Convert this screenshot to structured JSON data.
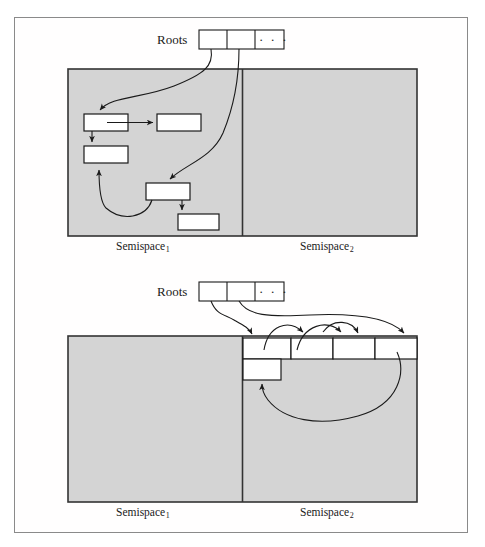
{
  "figure": {
    "background_color": "#ffffff",
    "frame_color": "#8a8a8a",
    "semispace_fill": "#d4d4d4",
    "semispace_stroke": "#333333",
    "object_fill": "#ffffff",
    "object_stroke": "#1a1a1a",
    "arrow_color": "#1a1a1a"
  },
  "panels": [
    {
      "id": "before",
      "roots": {
        "label": "Roots",
        "cells": [
          "",
          "",
          "· · ·"
        ],
        "cell_count": 3
      },
      "semispaces": [
        {
          "id": "semispace-1",
          "label": "Semispace",
          "subscript": "1",
          "state": "occupied"
        },
        {
          "id": "semispace-2",
          "label": "Semispace",
          "subscript": "2",
          "state": "empty"
        }
      ],
      "objects": [
        {
          "id": "obj-a",
          "x": 84,
          "y": 114,
          "w": 44,
          "h": 17
        },
        {
          "id": "obj-b",
          "x": 157,
          "y": 114,
          "w": 44,
          "h": 17
        },
        {
          "id": "obj-c",
          "x": 84,
          "y": 146,
          "w": 44,
          "h": 17
        },
        {
          "id": "obj-d",
          "x": 146,
          "y": 183,
          "w": 44,
          "h": 17
        },
        {
          "id": "obj-e",
          "x": 178,
          "y": 214,
          "w": 41,
          "h": 16
        }
      ]
    },
    {
      "id": "after",
      "roots": {
        "label": "Roots",
        "cells": [
          "",
          "",
          "· · ·"
        ],
        "cell_count": 3
      },
      "semispaces": [
        {
          "id": "semispace-1",
          "label": "Semispace",
          "subscript": "1",
          "state": "empty"
        },
        {
          "id": "semispace-2",
          "label": "Semispace",
          "subscript": "2",
          "state": "occupied"
        }
      ],
      "compacted_cells": [
        {
          "id": "cell-1",
          "x": 243,
          "y": 340,
          "w": 48,
          "h": 19
        },
        {
          "id": "cell-2",
          "x": 291,
          "y": 340,
          "w": 42,
          "h": 19
        },
        {
          "id": "cell-3",
          "x": 333,
          "y": 340,
          "w": 42,
          "h": 19
        },
        {
          "id": "cell-4",
          "x": 375,
          "y": 340,
          "w": 42,
          "h": 19
        },
        {
          "id": "cell-5",
          "x": 243,
          "y": 359,
          "w": 38,
          "h": 20
        }
      ]
    }
  ]
}
